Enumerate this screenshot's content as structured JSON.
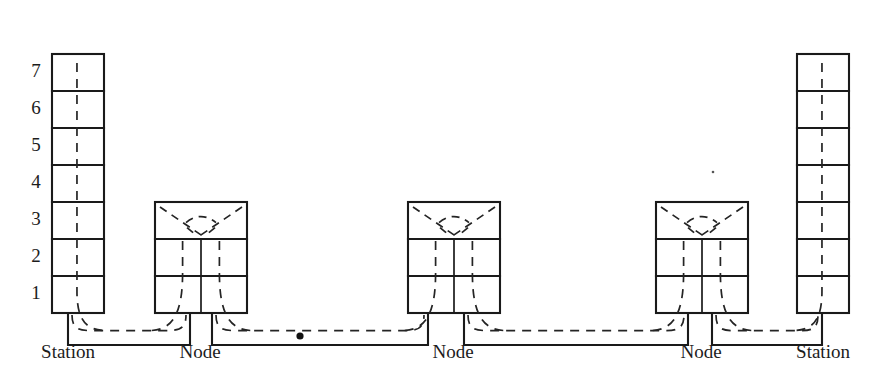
{
  "figure": {
    "type": "schematic-diagram",
    "background_color": "#ffffff",
    "line_color": "#1a1a1a",
    "track_color": "#242424",
    "width": 881,
    "height": 390
  },
  "axis": {
    "name": "level-axis",
    "orientation": "vertical",
    "label_x": 36,
    "levels": [
      {
        "label": "1",
        "y": 295
      },
      {
        "label": "2",
        "y": 258
      },
      {
        "label": "3",
        "y": 221
      },
      {
        "label": "4",
        "y": 184
      },
      {
        "label": "5",
        "y": 147
      },
      {
        "label": "6",
        "y": 110
      },
      {
        "label": "7",
        "y": 73
      }
    ]
  },
  "geometry": {
    "baseline_y": 313,
    "level_height": 37,
    "connector_depth": 32,
    "station_levels": 7,
    "node_levels": 3
  },
  "structures": [
    {
      "kind": "station",
      "name": "station-left",
      "caption": "Station",
      "x": 52,
      "width": 52,
      "levels": 7,
      "caption_x": 68,
      "shaft_dir": "right"
    },
    {
      "kind": "node",
      "name": "node-1",
      "caption": "Node",
      "x": 155,
      "width": 92,
      "levels": 3,
      "caption_x": 200,
      "shaft_dir": "both"
    },
    {
      "kind": "node",
      "name": "node-2",
      "caption": "Node",
      "x": 408,
      "width": 92,
      "levels": 3,
      "caption_x": 453,
      "shaft_dir": "both"
    },
    {
      "kind": "node",
      "name": "node-3",
      "caption": "Node",
      "x": 656,
      "width": 92,
      "levels": 3,
      "caption_x": 701,
      "shaft_dir": "both"
    },
    {
      "kind": "station",
      "name": "station-right",
      "caption": "Station",
      "x": 797,
      "width": 52,
      "levels": 7,
      "caption_x": 823,
      "shaft_dir": "left"
    }
  ],
  "connectors": [
    {
      "name": "connector-1",
      "x1": 68,
      "x2": 190,
      "has_marker": false
    },
    {
      "name": "connector-2",
      "x1": 212,
      "x2": 428,
      "has_marker": true,
      "marker_x": 300
    },
    {
      "name": "connector-3",
      "x1": 464,
      "x2": 688,
      "has_marker": false
    },
    {
      "name": "connector-4",
      "x1": 712,
      "x2": 822,
      "has_marker": false
    }
  ],
  "captions": {
    "station": "Station",
    "node": "Node",
    "caption_y": 358
  },
  "markers": [
    {
      "name": "track-marker-dot",
      "x": 300,
      "y": 336,
      "radius": 3.6
    },
    {
      "name": "page-speck",
      "x": 713,
      "y": 172,
      "radius": 1.3
    }
  ]
}
